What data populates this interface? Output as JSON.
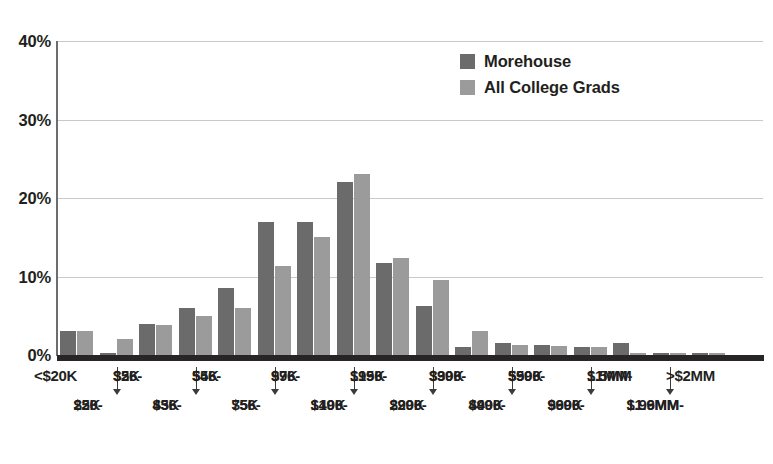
{
  "chart_data": {
    "type": "bar",
    "title": "",
    "subtitle": "",
    "xlabel": "",
    "ylabel": "",
    "ylim": [
      0,
      40
    ],
    "y_ticks": [
      "0%",
      "10%",
      "20%",
      "30%",
      "40%"
    ],
    "y_tick_values": [
      0,
      10,
      20,
      30,
      40
    ],
    "grid": true,
    "legend_position": "top-right",
    "colors": {
      "morehouse": "#6b6b6b",
      "all_college_grads": "#9b9b9b",
      "gridline": "#c9c9c9",
      "axis": "#272525",
      "text": "#231f20",
      "background": "#ffffff"
    },
    "categories": [
      "<$20K",
      "$20-25K",
      "$26-35K",
      "$36-45K",
      "$46-55K",
      "$56-75K",
      "$76-99K",
      "$100-149K",
      "$150-199K",
      "$200-299K",
      "$300-399K",
      "$400-499K",
      "$500-599K",
      "$600-999K",
      "$1MM-1.5MM",
      "$1.6MM-1.99MM",
      ">$2MM"
    ],
    "category_lines": [
      [
        "<$20K"
      ],
      [
        "$20-",
        "25K"
      ],
      [
        "$26-",
        "35K"
      ],
      [
        "$36-",
        "45K"
      ],
      [
        "$46-",
        "55K"
      ],
      [
        "$56-",
        "75K"
      ],
      [
        "$76-",
        "99K"
      ],
      [
        "$100-",
        "149K"
      ],
      [
        "$150-",
        "199K"
      ],
      [
        "$200-",
        "299K"
      ],
      [
        "$300-",
        "399K"
      ],
      [
        "$400-",
        "499K"
      ],
      [
        "$500-",
        "599K"
      ],
      [
        "$600-",
        "999K"
      ],
      [
        "$1MM-",
        "1.5MM"
      ],
      [
        "$1.6MM-",
        "1.99MM"
      ],
      [
        ">$2MM"
      ]
    ],
    "series": [
      {
        "name": "Morehouse",
        "values": [
          3.0,
          0.2,
          4.0,
          6.0,
          8.5,
          17.0,
          17.0,
          22.0,
          11.7,
          6.3,
          1.0,
          1.5,
          1.3,
          1.0,
          1.5,
          0.2,
          0.2
        ]
      },
      {
        "name": "All College Grads",
        "values": [
          3.0,
          2.0,
          3.8,
          5.0,
          6.0,
          11.3,
          15.0,
          23.0,
          12.3,
          9.5,
          3.0,
          1.3,
          1.2,
          1.0,
          0.3,
          0.2,
          0.3
        ]
      }
    ]
  }
}
